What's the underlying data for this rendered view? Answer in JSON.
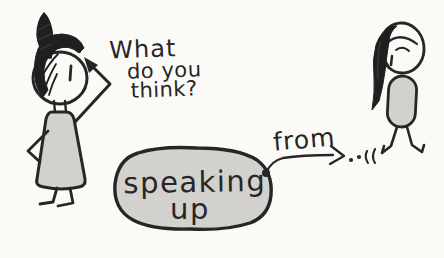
{
  "palette": {
    "background": "#fbfaf7",
    "ink": "#262626",
    "shade_gray": "#d2d1cd"
  },
  "question": {
    "line1": "What",
    "line2": "do you",
    "line3": "think?"
  },
  "speech_blob": {
    "line1": "speaking",
    "line2": "up"
  },
  "arrow": {
    "label": "from",
    "trailing_marks": "..''"
  }
}
